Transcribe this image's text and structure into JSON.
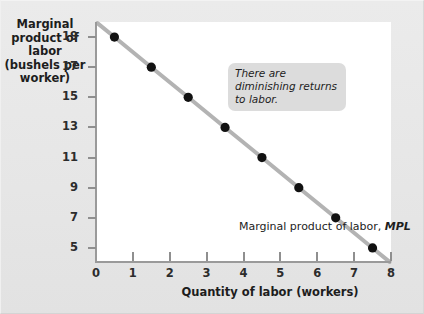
{
  "chart_data": {
    "type": "line",
    "title": "",
    "subtitle": "",
    "xlabel": "Quantity of labor (workers)",
    "ylabel": "Marginal\nproduct of labor\n(bushels per\nworker)",
    "xlim": [
      0,
      8
    ],
    "ylim": [
      4,
      20
    ],
    "grid": false,
    "legend": "none",
    "x_ticks": [
      "0",
      "1",
      "2",
      "3",
      "4",
      "5",
      "6",
      "7",
      "8"
    ],
    "x_tick_values": [
      0,
      1,
      2,
      3,
      4,
      5,
      6,
      7,
      8
    ],
    "y_ticks": [
      "19",
      "17",
      "15",
      "13",
      "11",
      "9",
      "7",
      "5"
    ],
    "y_tick_values": [
      19,
      17,
      15,
      13,
      11,
      9,
      7,
      5
    ],
    "series": [
      {
        "name": "Marginal product of labor, MPL",
        "line_color": "#b3b3b3",
        "marker_color": "#111111",
        "x": [
          0.5,
          1.5,
          2.5,
          3.5,
          4.5,
          5.5,
          6.5,
          7.5
        ],
        "values": [
          19,
          17,
          15,
          13,
          11,
          9,
          7,
          5
        ]
      }
    ],
    "annotations": [
      {
        "name": "diminishing-returns-note",
        "text": "There are diminishing returns to labor.",
        "style": "italic",
        "background": "#dcdcdc"
      },
      {
        "name": "curve-label",
        "text_plain": "Marginal product of labor,",
        "text_italic": "MPL"
      }
    ]
  },
  "axes": {
    "y_title": "Marginal\nproduct of labor\n(bushels per\nworker)",
    "x_title": "Quantity of labor (workers)"
  },
  "annotation": {
    "line1": "There are diminishing",
    "line2": "returns to labor.",
    "full": "There are diminishing returns to labor."
  },
  "curve_label": {
    "prefix": "Marginal product of labor, ",
    "symbol": "MPL"
  },
  "colors": {
    "panel_background": "#ffffff",
    "figure_background": "#e6e6e6",
    "axis": "#9a9a9a",
    "line": "#b3b3b3",
    "marker": "#111111",
    "annotation_background": "#dcdcdc",
    "text": "#1d1d1d"
  }
}
